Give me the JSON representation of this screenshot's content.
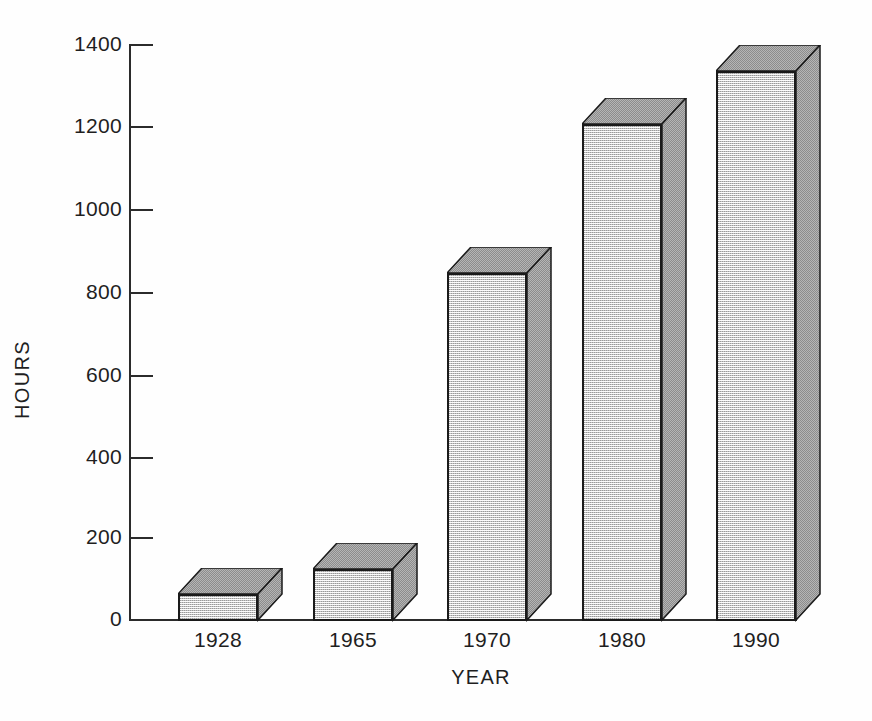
{
  "chart_data": {
    "type": "bar",
    "title": "",
    "subtitle": "",
    "xlabel": "YEAR",
    "ylabel": "HOURS",
    "categories": [
      "1928",
      "1965",
      "1970",
      "1980",
      "1990"
    ],
    "values": [
      65,
      125,
      845,
      1205,
      1335
    ],
    "series": [
      {
        "name": "Hours",
        "values": [
          65,
          125,
          845,
          1205,
          1335
        ]
      }
    ],
    "ylim": [
      0,
      1400
    ],
    "yticks": [
      0,
      200,
      400,
      600,
      800,
      1000,
      1200,
      1400
    ],
    "ytick_labels": [
      "0",
      "200",
      "400",
      "600",
      "800",
      "1000",
      "1200",
      "1400"
    ],
    "grid": false,
    "legend": false,
    "legend_position": "none",
    "style": "3d-bar",
    "colors": {
      "bar_front": "#c4c4c4",
      "bar_side": "#8f8f8f",
      "bar_top": "#8f8f8f",
      "outline": "#1a1a1a",
      "axis": "#2b2b2b",
      "background": "#ffffff",
      "text": "#1f1f1f"
    }
  },
  "axes": {
    "y_title": "HOURS",
    "x_title": "YEAR"
  }
}
